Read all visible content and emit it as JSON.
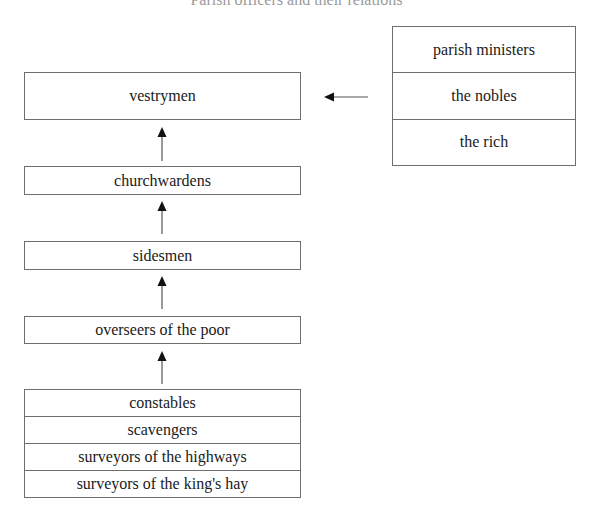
{
  "diagram": {
    "title": "Parish officers and their relations",
    "hierarchy": [
      {
        "id": "vestrymen",
        "label": "vestrymen"
      },
      {
        "id": "churchwardens",
        "label": "churchwardens"
      },
      {
        "id": "sidesmen",
        "label": "sidesmen"
      },
      {
        "id": "overseers",
        "label": "overseers of the poor"
      },
      {
        "id": "lower_officers",
        "rows": [
          "constables",
          "scavengers",
          "surveyors of the highways",
          "surveyors of the king's hay"
        ]
      }
    ],
    "influencers": {
      "rows": [
        "parish ministers",
        "the nobles",
        "the rich"
      ]
    },
    "edges": [
      {
        "from": "churchwardens",
        "to": "vestrymen"
      },
      {
        "from": "sidesmen",
        "to": "churchwardens"
      },
      {
        "from": "overseers",
        "to": "sidesmen"
      },
      {
        "from": "lower_officers",
        "to": "overseers"
      },
      {
        "from": "influencers",
        "to": "vestrymen"
      }
    ],
    "colors": {
      "border": "#6e6e6e",
      "text": "#1a1a1a",
      "arrow": "#1a1a1a",
      "background": "#ffffff"
    }
  }
}
